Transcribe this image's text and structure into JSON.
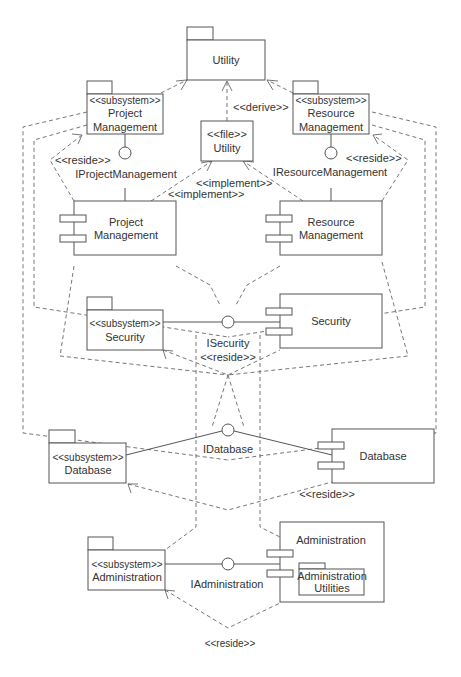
{
  "diagram": {
    "type": "UML component diagram",
    "packages": {
      "utility": {
        "label": "Utility"
      },
      "project_mgmt": {
        "stereotype": "<<subsystem>>",
        "line1": "Project",
        "line2": "Management"
      },
      "resource_mgmt": {
        "stereotype": "<<subsystem>>",
        "line1": "Resource",
        "line2": "Management"
      },
      "security": {
        "stereotype": "<<subsystem>>",
        "line1": "Security"
      },
      "database": {
        "stereotype": "<<subsystem>>",
        "line1": "Database"
      },
      "administration": {
        "stereotype": "<<subsystem>>",
        "line1": "Administration"
      },
      "admin_utilities": {
        "line1": "Administration",
        "line2": "Utilities"
      }
    },
    "file": {
      "stereotype": "<<file>>",
      "label": "Utility"
    },
    "components": {
      "project_mgmt": {
        "line1": "Project",
        "line2": "Management"
      },
      "resource_mgmt": {
        "line1": "Resource",
        "line2": "Management"
      },
      "security": {
        "label": "Security"
      },
      "database": {
        "label": "Database"
      },
      "administration": {
        "label": "Administration"
      }
    },
    "interfaces": {
      "project_mgmt": "IProjectManagement",
      "resource_mgmt": "IResourceManagement",
      "security": "ISecurity",
      "database": "IDatabase",
      "administration": "IAdministration"
    },
    "labels": {
      "derive": "<<derive>>",
      "implement_1": "<<implement>>",
      "implement_2": "<<implement>>",
      "reside_pm": "<<reside>>",
      "reside_rm": "<<reside>>",
      "reside_sec": "<<reside>>",
      "reside_db": "<<reside>>",
      "reside_admin": "<<reside>>"
    }
  }
}
